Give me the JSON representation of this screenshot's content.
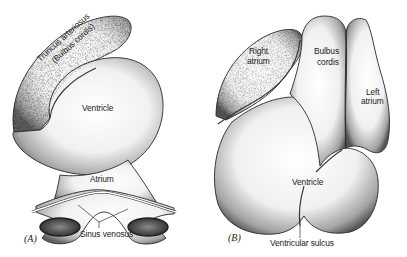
{
  "figure": {
    "panels": [
      {
        "id": "A",
        "panel_label": "(A)",
        "labels": {
          "truncus_line1": "Truncus arteriosus",
          "truncus_line2": "(Bulbus cordis)",
          "ventricle": "Ventricle",
          "atrium": "Atrium",
          "sinus_venosus": "Sinus venosus"
        }
      },
      {
        "id": "B",
        "panel_label": "(B)",
        "labels": {
          "right_atrium_line1": "Right",
          "right_atrium_line2": "atrium",
          "bulbus_line1": "Bulbus",
          "bulbus_line2": "cordis",
          "left_atrium_line1": "Left",
          "left_atrium_line2": "atrium",
          "ventricle": "Ventricle",
          "ventricular_sulcus": "Ventricular sulcus"
        }
      }
    ],
    "colors": {
      "background": "#ffffff",
      "ink": "#222222",
      "shade": "#6b6b6b"
    }
  }
}
